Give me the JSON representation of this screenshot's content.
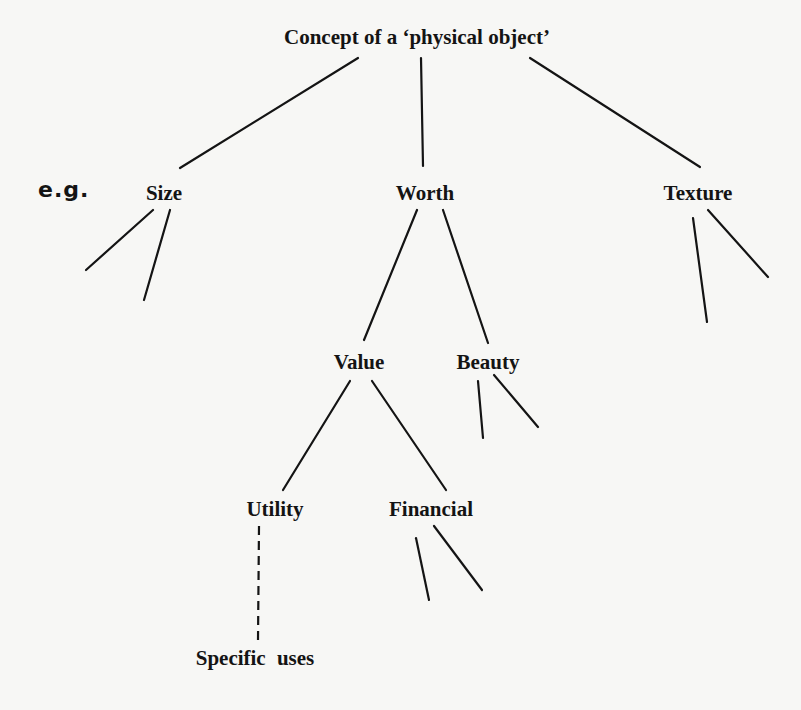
{
  "diagram": {
    "annotation": "e.g.",
    "nodes": {
      "root": "Concept of a ‘physical object’",
      "size": "Size",
      "worth": "Worth",
      "texture": "Texture",
      "value": "Value",
      "beauty": "Beauty",
      "utility": "Utility",
      "financial": "Financial",
      "specific_uses": "Specific uses"
    },
    "edges": [
      {
        "from": "Concept of a ‘physical object’",
        "to": "Size",
        "style": "solid"
      },
      {
        "from": "Concept of a ‘physical object’",
        "to": "Worth",
        "style": "solid"
      },
      {
        "from": "Concept of a ‘physical object’",
        "to": "Texture",
        "style": "solid"
      },
      {
        "from": "Worth",
        "to": "Value",
        "style": "solid"
      },
      {
        "from": "Worth",
        "to": "Beauty",
        "style": "solid"
      },
      {
        "from": "Value",
        "to": "Utility",
        "style": "solid"
      },
      {
        "from": "Value",
        "to": "Financial",
        "style": "solid"
      },
      {
        "from": "Utility",
        "to": "Specific uses",
        "style": "dashed"
      },
      {
        "from": "Size",
        "to": "(unlabeled branch)",
        "style": "solid"
      },
      {
        "from": "Size",
        "to": "(unlabeled branch)",
        "style": "solid"
      },
      {
        "from": "Texture",
        "to": "(unlabeled branch)",
        "style": "solid"
      },
      {
        "from": "Texture",
        "to": "(unlabeled branch)",
        "style": "solid"
      },
      {
        "from": "Beauty",
        "to": "(unlabeled branch)",
        "style": "solid"
      },
      {
        "from": "Beauty",
        "to": "(unlabeled branch)",
        "style": "solid"
      },
      {
        "from": "Financial",
        "to": "(unlabeled branch)",
        "style": "solid"
      },
      {
        "from": "Financial",
        "to": "(unlabeled branch)",
        "style": "solid"
      }
    ],
    "colors": {
      "background": "#f7f7f5",
      "ink": "#141414"
    }
  }
}
